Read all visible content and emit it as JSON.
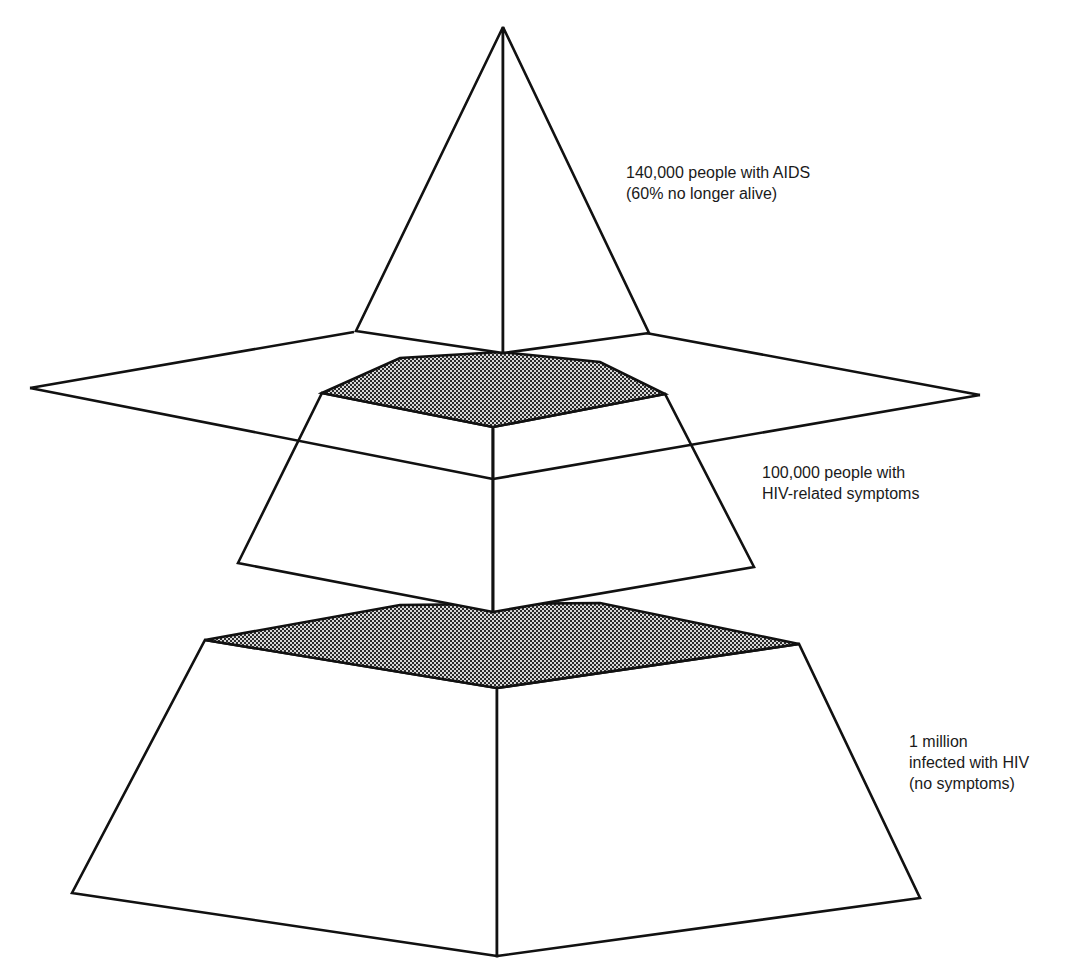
{
  "diagram": {
    "title": "",
    "colors": {
      "stroke": "#111111",
      "face": "#ffffff",
      "hatch_dark": "#2a2a2a",
      "hatch_light": "#d8d8d8"
    },
    "tiers": [
      {
        "id": "aids",
        "shape": "pyramid-apex",
        "label_lines": [
          "140,000 people with AIDS",
          "(60% no longer alive)"
        ]
      },
      {
        "id": "hiv-symptoms",
        "shape": "middle-frustum",
        "label_lines": [
          "100,000 people with",
          "HIV-related symptoms"
        ]
      },
      {
        "id": "hiv-no-symptoms",
        "shape": "base-frustum",
        "label_lines": [
          "1 million",
          "infected with HIV",
          "(no symptoms)"
        ]
      }
    ],
    "plane": {
      "id": "visibility-plane",
      "description": "horizontal plane separating visible tip from hidden layers"
    }
  }
}
